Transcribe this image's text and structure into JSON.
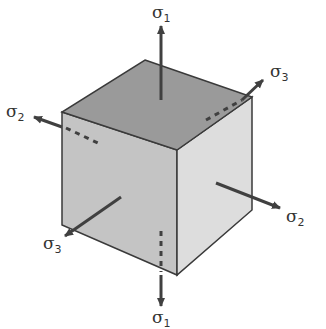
{
  "diagram": {
    "colors": {
      "top_face": "#9a9a9a",
      "left_face": "#c4c4c4",
      "right_face": "#dddddd",
      "edge": "#3a3a3a",
      "arrow": "#404040"
    },
    "labels": {
      "s1_top": {
        "symbol": "σ",
        "sub": "1"
      },
      "s1_bottom": {
        "symbol": "σ",
        "sub": "1"
      },
      "s2_left": {
        "symbol": "σ",
        "sub": "2"
      },
      "s2_right": {
        "symbol": "σ",
        "sub": "2"
      },
      "s3_top_right": {
        "symbol": "σ",
        "sub": "3"
      },
      "s3_bottom_left": {
        "symbol": "σ",
        "sub": "3"
      }
    }
  }
}
